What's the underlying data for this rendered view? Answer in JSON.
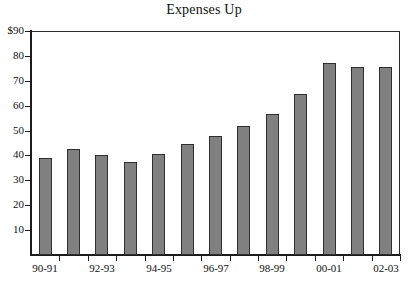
{
  "chart_data": {
    "type": "bar",
    "title": "Expenses Up",
    "xlabel": "",
    "ylabel": "",
    "ylim": [
      0,
      90
    ],
    "yticks": [
      10,
      20,
      30,
      40,
      50,
      60,
      70,
      80,
      90
    ],
    "ytick_labels": [
      "10",
      "20",
      "30",
      "40",
      "50",
      "60",
      "70",
      "80",
      "$90"
    ],
    "grid": false,
    "legend": "none",
    "categories": [
      "90-91",
      "91-92",
      "92-93",
      "93-94",
      "94-95",
      "95-96",
      "96-97",
      "97-98",
      "98-99",
      "99-00",
      "00-01",
      "01-02",
      "02-03"
    ],
    "visible_category_labels": [
      "90-91",
      "92-93",
      "94-95",
      "96-97",
      "98-99",
      "00-01",
      "02-03"
    ],
    "values": [
      39,
      42.5,
      40,
      37.5,
      40.5,
      44.5,
      48,
      52,
      56.5,
      64.5,
      77,
      75.5,
      75.5
    ],
    "bar_color": "#808080",
    "bar_border_color": "#2f2f2f",
    "axis_color": "#1c1c1c",
    "background_color": "#ffffff"
  }
}
